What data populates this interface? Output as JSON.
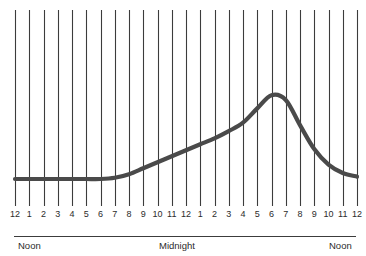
{
  "chart_data": {
    "type": "line",
    "title": "",
    "subtitle": "",
    "xlabel": "",
    "ylabel": "",
    "grid": "vertical-only",
    "legend": "none",
    "x_tick_labels": [
      "12",
      "1",
      "2",
      "3",
      "4",
      "5",
      "6",
      "7",
      "8",
      "9",
      "10",
      "11",
      "12",
      "1",
      "2",
      "3",
      "4",
      "5",
      "6",
      "7",
      "8",
      "9",
      "10",
      "11",
      "12"
    ],
    "x_hours_from_noon": [
      0,
      1,
      2,
      3,
      4,
      5,
      6,
      7,
      8,
      9,
      10,
      11,
      12,
      13,
      14,
      15,
      16,
      17,
      18,
      19,
      20,
      21,
      22,
      23,
      24
    ],
    "x_clock_times": [
      "12 Noon",
      "1 PM",
      "2 PM",
      "3 PM",
      "4 PM",
      "5 PM",
      "6 PM",
      "7 PM",
      "8 PM",
      "9 PM",
      "10 PM",
      "11 PM",
      "12 Midnight",
      "1 AM",
      "2 AM",
      "3 AM",
      "4 AM",
      "5 AM",
      "6 AM",
      "7 AM",
      "8 AM",
      "9 AM",
      "10 AM",
      "11 AM",
      "12 Noon"
    ],
    "period_labels": [
      {
        "text": "Noon",
        "at_hour": 0,
        "align": "left"
      },
      {
        "text": "Midnight",
        "at_hour": 12,
        "align": "center"
      },
      {
        "text": "Noon",
        "at_hour": 24,
        "align": "right"
      }
    ],
    "xlim": [
      0,
      24
    ],
    "ylim": [
      0,
      100
    ],
    "series": [
      {
        "name": "Level",
        "values": [
          10,
          10,
          10,
          10,
          10,
          10,
          10,
          11,
          14,
          19,
          24,
          29,
          34,
          39,
          44,
          50,
          57,
          69,
          80,
          76,
          55,
          35,
          22,
          15,
          12
        ]
      }
    ],
    "annotations": [
      {
        "text": "peak",
        "at_hour": 17.6,
        "value": 81
      },
      {
        "text": "baseline",
        "at_hour": 0,
        "value": 10
      }
    ],
    "colors": {
      "curve": "#4a4a4a",
      "gridline": "#3c3c3c",
      "axis_rule": "#3c3c3c",
      "text": "#2b2b2b",
      "background": "#ffffff"
    }
  },
  "geometry": {
    "grid_x_start": 15,
    "grid_x_end": 357,
    "grid_y_top": 10,
    "grid_y_bottom": 206,
    "tick_label_y": 209,
    "rule_y": 236,
    "rule_x_start": 14,
    "rule_x_end": 356,
    "period_label_y": 240,
    "baseline_y": 179,
    "peak_y": 94,
    "curve_width": 4.2,
    "gridline_width": 1.1
  }
}
